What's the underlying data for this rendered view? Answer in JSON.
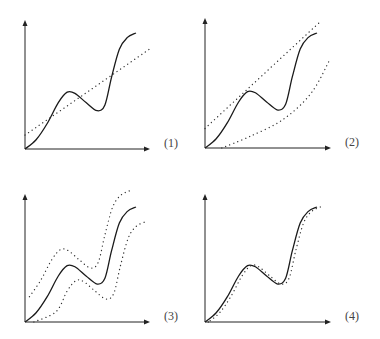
{
  "figure": {
    "panels": [
      {
        "id": 1,
        "label": "(1)",
        "fit": "linear",
        "bands": [
          "line"
        ]
      },
      {
        "id": 2,
        "label": "(2)",
        "fit": "linear-band",
        "bands": [
          "upper-line",
          "lower-line"
        ]
      },
      {
        "id": 3,
        "label": "(3)",
        "fit": "curve-band",
        "bands": [
          "upper-curve",
          "lower-curve"
        ]
      },
      {
        "id": 4,
        "label": "(4)",
        "fit": "close-fit",
        "bands": [
          "close-curve"
        ]
      }
    ]
  },
  "chart_data": {
    "type": "line",
    "title": "",
    "xlabel": "",
    "ylabel": "",
    "xlim": [
      0,
      1
    ],
    "ylim": [
      0,
      1
    ],
    "grid": false,
    "true_curve": {
      "name": "underlying function",
      "style": "solid",
      "x": [
        0,
        0.1,
        0.2,
        0.3,
        0.38,
        0.45,
        0.55,
        0.65,
        0.72,
        0.78,
        0.85,
        0.92,
        1.0
      ],
      "y": [
        0,
        0.08,
        0.22,
        0.4,
        0.49,
        0.48,
        0.4,
        0.33,
        0.38,
        0.62,
        0.86,
        0.96,
        1.0
      ]
    },
    "panels": [
      {
        "label": "(1)",
        "dotted_series": [
          {
            "name": "linear fit",
            "x": [
              0,
              1.12
            ],
            "y": [
              0.12,
              0.86
            ]
          }
        ]
      },
      {
        "label": "(2)",
        "dotted_series": [
          {
            "name": "upper linear bound",
            "x": [
              0,
              1.02
            ],
            "y": [
              0.17,
              1.09
            ]
          },
          {
            "name": "lower linear bound",
            "x": [
              0.15,
              0.4,
              0.7,
              0.95,
              1.12
            ],
            "y": [
              0,
              0.1,
              0.25,
              0.48,
              0.78
            ]
          }
        ]
      },
      {
        "label": "(3)",
        "dotted_series": [
          {
            "name": "upper curve bound",
            "offset_x": -0.06,
            "offset_y": 0.14
          },
          {
            "name": "lower curve bound",
            "offset_x": 0.08,
            "offset_y": -0.13
          }
        ]
      },
      {
        "label": "(4)",
        "dotted_series": [
          {
            "name": "close fit",
            "offset_x": 0.03,
            "offset_y": 0.0
          }
        ]
      }
    ]
  }
}
